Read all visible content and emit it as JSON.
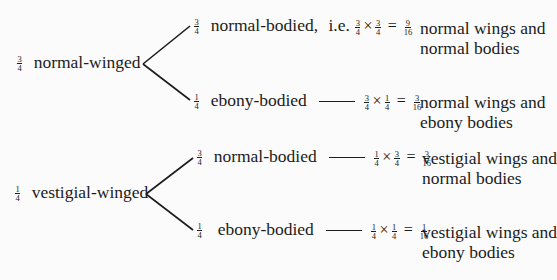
{
  "diagram": {
    "type": "probability-tree",
    "branches": [
      {
        "prob": {
          "num": "3",
          "den": "4"
        },
        "label": "normal-winged",
        "children": [
          {
            "prob": {
              "num": "3",
              "den": "4"
            },
            "label": "normal-bodied,",
            "connector": "i.e.",
            "calc": {
              "a": {
                "num": "3",
                "den": "4"
              },
              "b": {
                "num": "3",
                "den": "4"
              },
              "result": {
                "num": "9",
                "den": "16"
              }
            },
            "times": "×",
            "equals": "=",
            "result_line1": "normal wings and",
            "result_line2": "normal bodies"
          },
          {
            "prob": {
              "num": "1",
              "den": "4"
            },
            "label": "ebony-bodied",
            "connector": "",
            "calc": {
              "a": {
                "num": "3",
                "den": "4"
              },
              "b": {
                "num": "1",
                "den": "4"
              },
              "result": {
                "num": "3",
                "den": "16"
              }
            },
            "times": "×",
            "equals": "=",
            "result_line1": "normal wings and",
            "result_line2": "ebony bodies"
          }
        ]
      },
      {
        "prob": {
          "num": "1",
          "den": "4"
        },
        "label": "vestigial-winged",
        "children": [
          {
            "prob": {
              "num": "3",
              "den": "4"
            },
            "label": "normal-bodied",
            "connector": "",
            "calc": {
              "a": {
                "num": "1",
                "den": "4"
              },
              "b": {
                "num": "3",
                "den": "4"
              },
              "result": {
                "num": "3",
                "den": "16"
              }
            },
            "times": "×",
            "equals": "=",
            "result_line1": "vestigial wings and",
            "result_line2": "normal bodies"
          },
          {
            "prob": {
              "num": "1",
              "den": "4"
            },
            "label": "ebony-bodied",
            "connector": "",
            "calc": {
              "a": {
                "num": "1",
                "den": "4"
              },
              "b": {
                "num": "1",
                "den": "4"
              },
              "result": {
                "num": "1",
                "den": "16"
              }
            },
            "times": "×",
            "equals": "=",
            "result_line1": "vestigial wings and",
            "result_line2": "ebony bodies"
          }
        ]
      }
    ]
  },
  "colors": {
    "ink": "#1c1c1c",
    "paper": "#fbfbfb",
    "bleed": "#e6e6e6"
  }
}
